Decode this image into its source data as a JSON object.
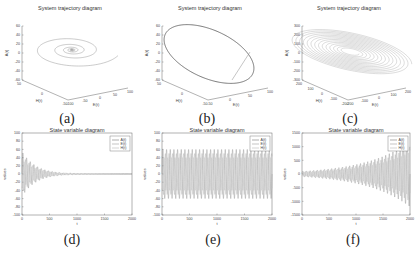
{
  "chart_data": [
    {
      "id": "a",
      "type": "line3d",
      "title": "System trajectory diagram",
      "caption": "(a)",
      "xlabel": "E(t)",
      "ylabel": "H(t)",
      "zlabel": "A(t)",
      "x_ticks": [
        "-100",
        "-50",
        "0",
        "50",
        "100"
      ],
      "y_ticks": [
        "-50",
        "0",
        "50"
      ],
      "z_ticks": [
        "-60",
        "-40",
        "-20",
        "0",
        "20",
        "40",
        "60"
      ],
      "description": "Converging spiral toward the origin (stable focus)",
      "shape": "spiral-in"
    },
    {
      "id": "b",
      "type": "line3d",
      "title": "System trajectory diagram",
      "caption": "(b)",
      "xlabel": "E(t)",
      "ylabel": "H(t)",
      "zlabel": "A(t)",
      "x_ticks": [
        "-50",
        "0",
        "50",
        "100"
      ],
      "y_ticks": [
        "-50",
        "0",
        "50"
      ],
      "z_ticks": [
        "-60",
        "-40",
        "-20",
        "0",
        "20",
        "40",
        "60"
      ],
      "description": "Closed elliptical limit cycle with an approach line",
      "shape": "limit-cycle"
    },
    {
      "id": "c",
      "type": "line3d",
      "title": "System trajectory diagram",
      "caption": "(c)",
      "xlabel": "E(t)",
      "ylabel": "H(t)",
      "zlabel": "A(t)",
      "x_ticks": [
        "-200",
        "-100",
        "0",
        "100",
        "200"
      ],
      "y_ticks": [
        "-200",
        "-100",
        "0",
        "100",
        "200"
      ],
      "z_ticks": [
        "-300",
        "-200",
        "-100",
        "0",
        "100",
        "200",
        "300"
      ],
      "description": "Diverging spiral moving outward from the origin",
      "shape": "spiral-out"
    },
    {
      "id": "d",
      "type": "line",
      "title": "State variable diagram",
      "caption": "(d)",
      "xlabel": "t",
      "ylabel": "values",
      "xlim": [
        0,
        2000
      ],
      "ylim": [
        -100,
        100
      ],
      "x_ticks": [
        "0",
        "500",
        "1000",
        "1500",
        "2000"
      ],
      "y_ticks": [
        "100",
        "80",
        "60",
        "40",
        "20",
        "0",
        "-20",
        "-40",
        "-60",
        "-80",
        "-100"
      ],
      "legend": [
        "A(t)",
        "E(t)",
        "H(t)"
      ],
      "legend_position": "upper right",
      "series": [
        {
          "name": "A(t)",
          "behavior": "damped oscillation",
          "initial_amplitude": 55,
          "decays_by": 600
        },
        {
          "name": "E(t)",
          "behavior": "damped oscillation",
          "initial_amplitude": 45,
          "decays_by": 600
        },
        {
          "name": "H(t)",
          "behavior": "damped oscillation",
          "initial_amplitude": 35,
          "decays_by": 600
        }
      ]
    },
    {
      "id": "e",
      "type": "line",
      "title": "State variable diagram",
      "caption": "(e)",
      "xlabel": "t",
      "ylabel": "values",
      "xlim": [
        0,
        2000
      ],
      "ylim": [
        -100,
        100
      ],
      "x_ticks": [
        "0",
        "500",
        "1000",
        "1500",
        "2000"
      ],
      "y_ticks": [
        "100",
        "80",
        "60",
        "40",
        "20",
        "0",
        "-20",
        "-40",
        "-60",
        "-80",
        "-100"
      ],
      "legend": [
        "A(t)",
        "E(t)",
        "H(t)"
      ],
      "legend_position": "upper right",
      "series": [
        {
          "name": "A(t)",
          "behavior": "sustained oscillation",
          "amplitude": 60
        },
        {
          "name": "E(t)",
          "behavior": "sustained oscillation",
          "amplitude": 50
        },
        {
          "name": "H(t)",
          "behavior": "sustained oscillation",
          "amplitude": 40
        }
      ]
    },
    {
      "id": "f",
      "type": "line",
      "title": "State variable diagram",
      "caption": "(f)",
      "xlabel": "t",
      "ylabel": "values",
      "xlim": [
        0,
        2000
      ],
      "ylim": [
        -1500,
        1500
      ],
      "x_ticks": [
        "0",
        "500",
        "1000",
        "1500",
        "2000"
      ],
      "y_ticks": [
        "1500",
        "1000",
        "500",
        "0",
        "-500",
        "-1000",
        "-1500"
      ],
      "legend": [
        "A(t)",
        "E(t)",
        "H(t)"
      ],
      "legend_position": "upper right",
      "series": [
        {
          "name": "A(t)",
          "behavior": "growing oscillation",
          "initial_amplitude": 100,
          "final_amplitude": 1200
        },
        {
          "name": "E(t)",
          "behavior": "growing oscillation",
          "initial_amplitude": 80,
          "final_amplitude": 1000
        },
        {
          "name": "H(t)",
          "behavior": "growing oscillation",
          "initial_amplitude": 60,
          "final_amplitude": 800
        }
      ]
    }
  ],
  "colors": {
    "line": "#8a8a8a",
    "line_dark": "#555555",
    "axis": "#666666",
    "series": [
      "#7a7a7a",
      "#a0a0a0",
      "#b8b8b8"
    ]
  }
}
